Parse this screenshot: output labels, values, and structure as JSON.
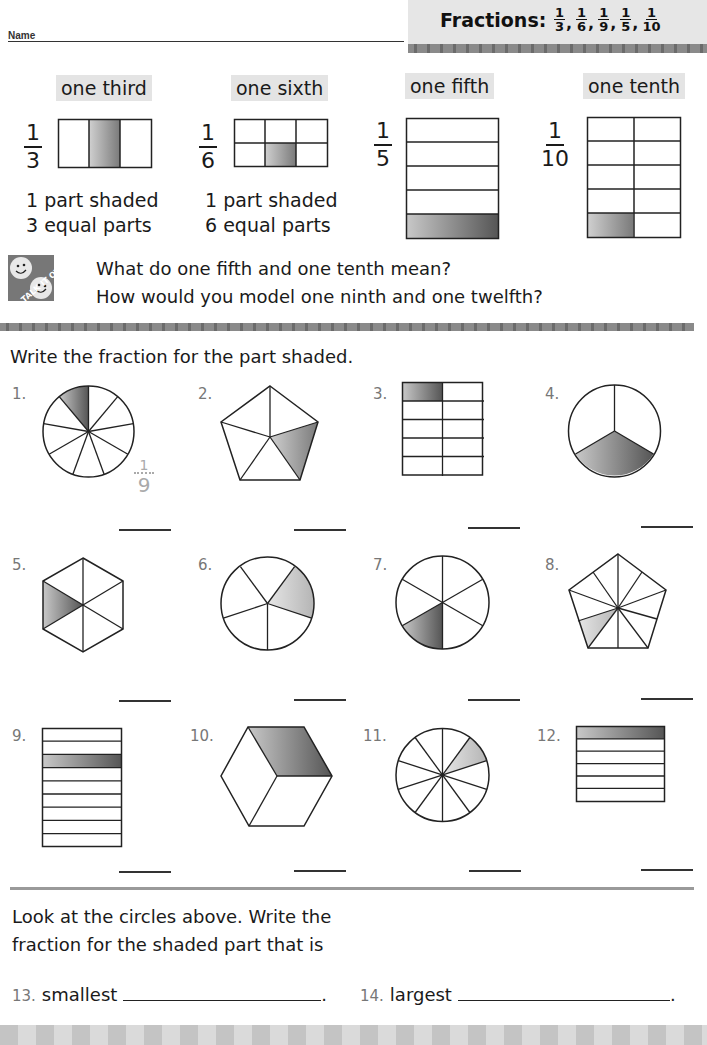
{
  "header": {
    "name_label": "Name",
    "title": {
      "prefix": "Fractions:",
      "fractions": [
        {
          "num": "1",
          "den": "3"
        },
        {
          "num": "1",
          "den": "6"
        },
        {
          "num": "1",
          "den": "9"
        },
        {
          "num": "1",
          "den": "5"
        },
        {
          "num": "1",
          "den": "10"
        }
      ]
    }
  },
  "examples": [
    {
      "label": "one third",
      "num": "1",
      "den": "3",
      "line1": "1 part shaded",
      "line2": "3 equal parts"
    },
    {
      "label": "one sixth",
      "num": "1",
      "den": "6",
      "line1": "1 part shaded",
      "line2": "6 equal parts"
    },
    {
      "label": "one fifth",
      "num": "1",
      "den": "5"
    },
    {
      "label": "one tenth",
      "num": "1",
      "den": "10"
    }
  ],
  "talk_it_over": {
    "icon": "talk-it-over-smiley-icon",
    "icon_text": "TALK IT OVER",
    "questions": [
      "What do one fifth and one tenth mean?",
      "How would you model one ninth and one twelfth?"
    ]
  },
  "exercise": {
    "instruction": "Write the fraction for the part shaded.",
    "problems": [
      {
        "number": "1.",
        "shape": "circle",
        "parts": 9,
        "shaded": 1,
        "example_answer": {
          "num": "1",
          "den": "9"
        }
      },
      {
        "number": "2.",
        "shape": "pentagon",
        "parts": 5,
        "shaded": 1
      },
      {
        "number": "3.",
        "shape": "grid-2x5",
        "parts": 10,
        "shaded": 1
      },
      {
        "number": "4.",
        "shape": "circle",
        "parts": 3,
        "shaded": 1
      },
      {
        "number": "5.",
        "shape": "hexagon",
        "parts": 6,
        "shaded": 1
      },
      {
        "number": "6.",
        "shape": "circle",
        "parts": 5,
        "shaded": 1
      },
      {
        "number": "7.",
        "shape": "circle",
        "parts": 6,
        "shaded": 1
      },
      {
        "number": "8.",
        "shape": "pentagon",
        "parts": 10,
        "shaded": 1
      },
      {
        "number": "9.",
        "shape": "strips",
        "parts": 9,
        "shaded": 1
      },
      {
        "number": "10.",
        "shape": "hexagon-cube",
        "parts": 3,
        "shaded": 1
      },
      {
        "number": "11.",
        "shape": "circle",
        "parts": 10,
        "shaded": 1
      },
      {
        "number": "12.",
        "shape": "strips",
        "parts": 6,
        "shaded": 1
      }
    ]
  },
  "comparison": {
    "prompt_line1": "Look at the circles above. Write the",
    "prompt_line2": "fraction for the shaded part that is",
    "items": [
      {
        "number": "13.",
        "label": "smallest",
        "end": "."
      },
      {
        "number": "14.",
        "label": "largest",
        "end": "."
      }
    ]
  }
}
